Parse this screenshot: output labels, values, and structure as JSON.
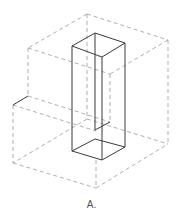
{
  "figure": {
    "label": "A.",
    "colors": {
      "solid": "#3a3a3a",
      "hidden": "#9a9a9a",
      "background": "#ffffff"
    },
    "hidden_lines": [
      [
        87,
        14,
        28,
        48
      ],
      [
        87,
        14,
        168,
        40
      ],
      [
        28,
        48,
        110,
        74
      ],
      [
        168,
        40,
        110,
        74
      ],
      [
        87,
        14,
        87,
        119
      ],
      [
        28,
        48,
        28,
        96
      ],
      [
        168,
        40,
        168,
        144
      ],
      [
        110,
        74,
        110,
        122
      ],
      [
        13,
        105,
        13,
        163
      ],
      [
        96,
        160,
        96,
        188
      ],
      [
        28,
        96,
        110,
        122
      ],
      [
        13,
        105,
        96,
        131
      ],
      [
        87,
        119,
        168,
        144
      ],
      [
        87,
        119,
        13,
        163
      ],
      [
        13,
        163,
        96,
        188
      ],
      [
        96,
        188,
        168,
        144
      ]
    ],
    "solid_lines": [
      [
        13,
        105,
        28,
        96
      ],
      [
        95,
        33,
        72,
        46
      ],
      [
        95,
        33,
        125,
        43
      ],
      [
        72,
        46,
        102,
        57
      ],
      [
        125,
        43,
        102,
        57
      ],
      [
        72,
        46,
        72,
        151
      ],
      [
        102,
        57,
        102,
        160
      ],
      [
        125,
        43,
        125,
        147
      ],
      [
        95,
        33,
        95,
        130
      ],
      [
        72,
        151,
        102,
        160
      ],
      [
        102,
        160,
        125,
        147
      ],
      [
        72,
        151,
        95,
        139
      ],
      [
        95,
        139,
        125,
        147
      ],
      [
        95,
        130,
        110,
        122
      ]
    ]
  }
}
